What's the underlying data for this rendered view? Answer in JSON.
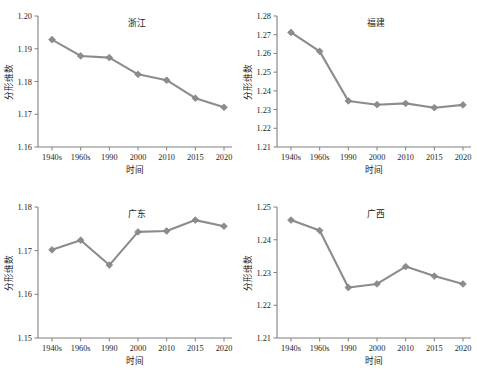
{
  "figure": {
    "name": "four-panel-fractal-dimension-time-series",
    "panel_count": 4,
    "colors": {
      "series": "#8c8c8c",
      "axis": "#808080",
      "text": "#1a1a1a"
    }
  },
  "chart_data": [
    {
      "type": "line",
      "panel": "top-left",
      "title": "浙江",
      "xlabel": "时间",
      "ylabel": "分形维数",
      "categories": [
        "1940s",
        "1960s",
        "1990",
        "2000",
        "2010",
        "2015",
        "2020"
      ],
      "values": [
        1.1928,
        1.1878,
        1.1873,
        1.1822,
        1.1804,
        1.1749,
        1.1721
      ],
      "ylim": [
        1.16,
        1.2
      ],
      "yticks": [
        "1.16",
        "1.17",
        "1.18",
        "1.19",
        "1.20"
      ],
      "ytick_values": [
        1.16,
        1.17,
        1.18,
        1.19,
        1.2
      ],
      "grid": false,
      "legend": "none",
      "marker": "diamond"
    },
    {
      "type": "line",
      "panel": "top-right",
      "title": "福建",
      "xlabel": "时间",
      "ylabel": "分形维数",
      "categories": [
        "1940s",
        "1960s",
        "1990",
        "2000",
        "2010",
        "2015",
        "2020"
      ],
      "values": [
        1.2712,
        1.2611,
        1.2346,
        1.2326,
        1.2333,
        1.231,
        1.2325
      ],
      "ylim": [
        1.21,
        1.28
      ],
      "yticks": [
        "1.21",
        "1.22",
        "1.23",
        "1.24",
        "1.25",
        "1.26",
        "1.27",
        "1.28"
      ],
      "ytick_values": [
        1.21,
        1.22,
        1.23,
        1.24,
        1.25,
        1.26,
        1.27,
        1.28
      ],
      "grid": false,
      "legend": "none",
      "marker": "diamond"
    },
    {
      "type": "line",
      "panel": "bottom-left",
      "title": "广东",
      "xlabel": "时间",
      "ylabel": "分形维数",
      "categories": [
        "1940s",
        "1960s",
        "1990",
        "2000",
        "2010",
        "2015",
        "2020"
      ],
      "values": [
        1.1702,
        1.1724,
        1.1667,
        1.1743,
        1.1745,
        1.177,
        1.1756
      ],
      "ylim": [
        1.15,
        1.18
      ],
      "yticks": [
        "1.15",
        "1.16",
        "1.17",
        "1.18"
      ],
      "ytick_values": [
        1.15,
        1.16,
        1.17,
        1.18
      ],
      "grid": false,
      "legend": "none",
      "marker": "diamond"
    },
    {
      "type": "line",
      "panel": "bottom-right",
      "title": "广西",
      "xlabel": "时间",
      "ylabel": "分形维数",
      "categories": [
        "1940s",
        "1960s",
        "1990",
        "2000",
        "2010",
        "2015",
        "2020"
      ],
      "values": [
        1.246,
        1.2428,
        1.2254,
        1.2265,
        1.2318,
        1.2289,
        1.2265
      ],
      "ylim": [
        1.21,
        1.25
      ],
      "yticks": [
        "1.21",
        "1.22",
        "1.23",
        "1.24",
        "1.25"
      ],
      "ytick_values": [
        1.21,
        1.22,
        1.23,
        1.24,
        1.25
      ],
      "grid": false,
      "legend": "none",
      "marker": "diamond"
    }
  ]
}
